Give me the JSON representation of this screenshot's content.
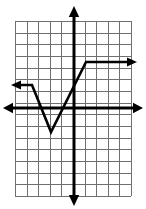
{
  "figure": {
    "width": 146,
    "height": 209,
    "background_color": "#ffffff"
  },
  "chart_data": {
    "type": "line",
    "title": "",
    "xlabel": "",
    "ylabel": "",
    "grid": true,
    "legend": false,
    "grid_spec": {
      "columns": 10,
      "rows": 15,
      "cell_width_px": 11.6,
      "cell_height_px": 11.67,
      "left_px": 15,
      "top_px": 21,
      "right_px": 131,
      "bottom_px": 196,
      "grid_color": "#6f6f6f",
      "grid_line_width": 1
    },
    "axes": {
      "origin_px": [
        74,
        108
      ],
      "x_axis": {
        "y_px": 108,
        "x_start_px": 7,
        "x_end_px": 139,
        "arrows": "both",
        "color": "#000000",
        "line_width": 3
      },
      "y_axis": {
        "x_px": 74,
        "y_start_px": 11,
        "y_end_px": 201,
        "arrows": "both",
        "color": "#000000",
        "line_width": 3
      },
      "xlim": [
        -5.2,
        4.9
      ],
      "ylim": [
        -7.5,
        7.4
      ],
      "x_unit_px": 11.6,
      "y_unit_px": 11.67
    },
    "series": [
      {
        "name": "piecewise-graph",
        "color": "#000000",
        "line_width": 2.6,
        "arrow_start": true,
        "arrow_end": true,
        "points_px": [
          [
            15,
            85
          ],
          [
            32,
            85
          ],
          [
            51,
            132
          ],
          [
            86,
            62
          ],
          [
            133,
            62
          ]
        ],
        "points_data": [
          [
            -5.1,
            2.0
          ],
          [
            -3.6,
            2.0
          ],
          [
            -2.0,
            -2.0
          ],
          [
            1.0,
            4.0
          ],
          [
            5.1,
            4.0
          ]
        ],
        "vertices_data": [
          [
            -3.6,
            2.0
          ],
          [
            -2.0,
            -2.0
          ],
          [
            1.0,
            4.0
          ]
        ],
        "description": "Ray from left at y=2, descends to vertex (-2,-2), ascends to (1,4), then horizontal ray to the right at y=4"
      }
    ]
  }
}
